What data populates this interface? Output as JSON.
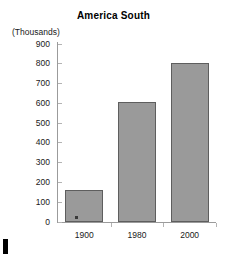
{
  "chart_data": {
    "type": "bar",
    "title": "America South",
    "xlabel": "",
    "ylabel": "(Thousands)",
    "categories": [
      "1900",
      "1980",
      "2000"
    ],
    "values": [
      160,
      605,
      805
    ],
    "ylim": [
      0,
      900
    ],
    "ytick_labels": [
      "900",
      "800",
      "700",
      "600",
      "500",
      "400",
      "300",
      "200",
      "100",
      "0"
    ],
    "ytick_values": [
      900,
      800,
      700,
      600,
      500,
      400,
      300,
      200,
      100,
      0
    ],
    "grid": false,
    "legend": "none",
    "series": [
      {
        "name": "Population",
        "values": [
          160,
          605,
          805
        ]
      }
    ],
    "colors": {
      "bar_fill": "#9a9a9a",
      "bar_border": "#5e5e5e",
      "axis": "#9b9b9b",
      "text": "#1a1a1a",
      "background": "#ffffff"
    }
  },
  "artifacts": {
    "speck_label": "scan-speck",
    "corner_label": "scan-edge-mark"
  }
}
